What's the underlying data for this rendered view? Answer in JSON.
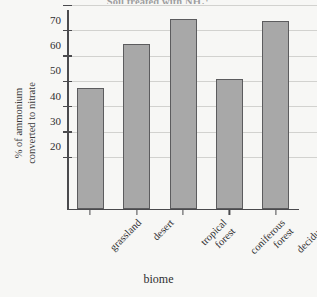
{
  "chart_data": {
    "type": "bar",
    "title": "Soil treated with NH₄⁺",
    "xlabel": "biome",
    "ylabel": "% of ammonium converted to nitrate",
    "ylabel_lines": [
      "% of ammonium",
      "converted to nitrate"
    ],
    "categories": [
      "grassland",
      "desert",
      "tropical forest",
      "coniferous forest",
      "deciduous forest"
    ],
    "category_lines": [
      [
        "grassland"
      ],
      [
        "desert"
      ],
      [
        "tropical",
        "forest"
      ],
      [
        "coniferous",
        "forest"
      ],
      [
        "deciduous",
        "forest"
      ]
    ],
    "values": [
      47.5,
      65,
      75,
      51,
      74
    ],
    "ylim": [
      0,
      85
    ],
    "yticks": [
      20,
      30,
      40,
      50,
      60,
      70,
      80
    ],
    "ytick_labels": [
      "20",
      "30",
      "40",
      "50",
      "60",
      "70",
      "80"
    ],
    "grid": true,
    "legend": "none",
    "bar_color": "#a8a8a8",
    "bar_border_color": "#5c5c5e",
    "axis_color": "#4a4a4d",
    "grid_color": "#d2d2cf",
    "background_color": "#f7f7f5"
  }
}
